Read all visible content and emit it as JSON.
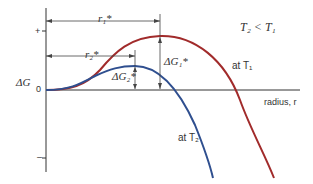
{
  "diagram": {
    "type": "free-energy-vs-radius",
    "y_axis": {
      "label": "ΔG",
      "plus_tick": "+",
      "zero_tick": "0",
      "minus_tick": "–"
    },
    "x_axis": {
      "label": "radius, r"
    },
    "condition": "T2 < T1",
    "curves": [
      {
        "name": "at T1",
        "color": "#a12b2b",
        "critical_radius_label": "r1*",
        "barrier_label": "ΔG1*"
      },
      {
        "name": "at T2",
        "color": "#2f4f8f",
        "critical_radius_label": "r2*",
        "barrier_label": "ΔG2*"
      }
    ],
    "labels": {
      "ylabel": "ΔG",
      "plus": "+",
      "zero": "0",
      "minus": "–",
      "xlabel": "radius, r",
      "condition": "T₂ < T₁",
      "r1": "r₁*",
      "r2": "r₂*",
      "dg1": "ΔG₁*",
      "dg2": "ΔG₂*",
      "at_t1": "at T₁",
      "at_t2": "at T₂"
    },
    "colors": {
      "t1_curve": "#a12b2b",
      "t2_curve": "#2f4f8f",
      "axis": "#333333"
    }
  }
}
